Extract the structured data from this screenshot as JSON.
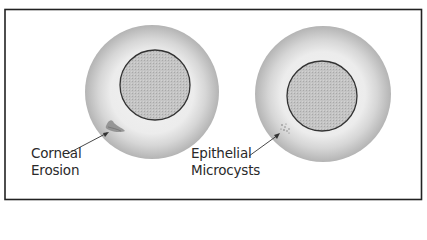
{
  "figure": {
    "colors": {
      "frame": "#222222",
      "ring_dark": "#b8b8b8",
      "ring_light": "#e8e8e8",
      "pupil_fill": "#bdbdbd",
      "pupil_stroke": "#333333",
      "erosion": "#7f7f7f",
      "arrow": "#333333"
    },
    "eyes": [
      {
        "name": "left-eye",
        "label_lines": [
          "Corneal",
          "Erosion"
        ],
        "lesion": "corneal-erosion"
      },
      {
        "name": "right-eye",
        "label_lines": [
          "Epithelial",
          "Microcysts"
        ],
        "lesion": "epithelial-microcysts"
      }
    ]
  }
}
